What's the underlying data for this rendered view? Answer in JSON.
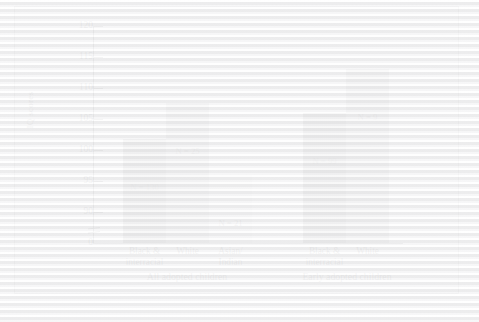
{
  "figure": {
    "y_axis_title": "IQ scores"
  },
  "chart_data": {
    "type": "bar",
    "title": "",
    "xlabel": "",
    "ylabel": "IQ scores",
    "ylim": [
      88,
      120
    ],
    "yticks": [
      0,
      90,
      95,
      100,
      105,
      110,
      115,
      120
    ],
    "ytick_labels": [
      "0",
      "90",
      "95",
      "100",
      "105",
      "110",
      "115",
      "120"
    ],
    "axis_break": true,
    "axis_break_between": [
      0,
      90
    ],
    "grid": false,
    "legend": "none",
    "groups": [
      {
        "label": "All adopted children",
        "categories": [
          "Black & interracial",
          "White",
          "Asian/ Indian"
        ],
        "values": [
          105,
          110.5,
          99
        ],
        "n_labels": [
          "N = 130",
          "N = 25",
          "N = 21"
        ],
        "n_values": [
          130,
          25,
          21
        ],
        "colors": [
          "#6e6e70",
          "#a3a3a5",
          "#d8d8d9"
        ]
      },
      {
        "label": "Early adopted children",
        "categories": [
          "Black & interracial",
          "White"
        ],
        "values": [
          109,
          116
        ],
        "n_labels": [
          "N = 99",
          "N = 9"
        ],
        "n_values": [
          99,
          9
        ],
        "colors": [
          "#6e6e70",
          "#a3a3a5"
        ]
      }
    ],
    "categories": [
      "Black & interracial",
      "White",
      "Asian/ Indian",
      "Black & interracial",
      "White"
    ],
    "values": [
      105,
      110.5,
      99,
      109,
      116
    ],
    "bar_labels": [
      "N = 130",
      "N = 25",
      "N = 21",
      "N = 99",
      "N = 9"
    ]
  },
  "bars": [
    {
      "id": "bar-1",
      "line1": "Black &",
      "line2": "interracial",
      "n": "N = 130",
      "value": 105,
      "color": "#6e6e70",
      "left": 108,
      "width": 43,
      "height": 104
    },
    {
      "id": "bar-2",
      "line1": "White",
      "line2": "",
      "n": "N = 25",
      "value": 110.5,
      "color": "#a3a3a5",
      "left": 151,
      "width": 43,
      "height": 140
    },
    {
      "id": "bar-3",
      "line1": "Asian/",
      "line2": "Indian",
      "n": "N = 21",
      "value": 99,
      "color": "#d8d8d9",
      "left": 194,
      "width": 43,
      "height": 68
    },
    {
      "id": "bar-4",
      "line1": "Black &",
      "line2": "interracial",
      "n": "N = 99",
      "value": 109,
      "color": "#6e6e70",
      "left": 288,
      "width": 43,
      "height": 130
    },
    {
      "id": "bar-5",
      "line1": "White",
      "line2": "",
      "n": "N = 9",
      "value": 116,
      "color": "#a3a3a5",
      "left": 331,
      "width": 43,
      "height": 174
    }
  ],
  "yticks": [
    {
      "label": "120",
      "top": 19
    },
    {
      "label": "115",
      "top": 50
    },
    {
      "label": "110",
      "top": 81
    },
    {
      "label": "105",
      "top": 112
    },
    {
      "label": "100",
      "top": 143
    },
    {
      "label": "95",
      "top": 174
    },
    {
      "label": "90",
      "top": 205
    },
    {
      "label": "0",
      "top": 236
    }
  ],
  "group_labels": [
    {
      "label": "All adopted children",
      "left": 92,
      "width": 160
    },
    {
      "label": "Early adopted children",
      "left": 252,
      "width": 160
    }
  ]
}
